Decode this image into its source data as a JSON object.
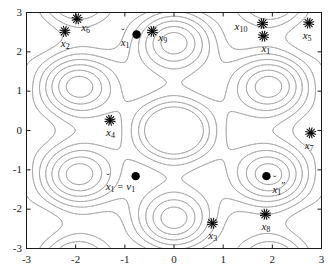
{
  "figure": {
    "kind": "contour-plot-with-scatter",
    "background_color": "#ffffff",
    "axis_color": "#1a1a1a",
    "contour_color": "#9a9a9a",
    "marker_color": "#000000",
    "width": 335,
    "height": 277
  },
  "axes": {
    "x": {
      "min": -3,
      "max": 3,
      "ticks": [
        -3,
        -2,
        -1,
        0,
        1,
        2,
        3
      ],
      "tick_labels": [
        "-3",
        "-2",
        "-1",
        "0",
        "1",
        "2",
        "3"
      ],
      "label": ""
    },
    "y": {
      "min": -3,
      "max": 3,
      "ticks": [
        -3,
        -2,
        -1,
        0,
        1,
        2,
        3
      ],
      "tick_labels": [
        "-3",
        "-2",
        "-1",
        "0",
        "1",
        "2",
        "3"
      ],
      "label": ""
    }
  },
  "chart_data": {
    "type": "scatter",
    "title": "",
    "xlabel": "",
    "ylabel": "",
    "xlim": [
      -3,
      3
    ],
    "ylim": [
      -3,
      3
    ],
    "grid": false,
    "legend": "none",
    "background_field": {
      "description": "light gray periodic contour lines of a hexagonal-lattice potential centered at origin",
      "color": "#9a9a9a",
      "levels": 9
    },
    "series": [
      {
        "name": "data points",
        "marker": "asterisk",
        "color": "#000000",
        "points": [
          {
            "label": "x_1",
            "label_text": "x",
            "sub": "1",
            "x": 1.82,
            "y": 2.4,
            "label_dx": -2,
            "label_dy": 14
          },
          {
            "label": "x_2",
            "label_text": "x",
            "sub": "2",
            "x": -2.22,
            "y": 2.52,
            "label_dx": -4,
            "label_dy": 14
          },
          {
            "label": "x_3",
            "label_text": "x",
            "sub": "3",
            "x": 0.78,
            "y": -2.36,
            "label_dx": -4,
            "label_dy": 14
          },
          {
            "label": "x_4",
            "label_text": "x",
            "sub": "4",
            "x": -1.3,
            "y": 0.26,
            "label_dx": -4,
            "label_dy": 14
          },
          {
            "label": "x_5",
            "label_text": "x",
            "sub": "5",
            "x": 2.74,
            "y": 2.73,
            "label_dx": -6,
            "label_dy": 14
          },
          {
            "label": "x_6",
            "label_text": "x",
            "sub": "6",
            "x": -1.97,
            "y": 2.84,
            "label_dx": 4,
            "label_dy": 10
          },
          {
            "label": "x_7",
            "label_text": "x",
            "sub": "7",
            "x": 2.78,
            "y": -0.06,
            "label_dx": -6,
            "label_dy": 14
          },
          {
            "label": "x_8",
            "label_text": "x",
            "sub": "8",
            "x": 1.86,
            "y": -2.13,
            "label_dx": -4,
            "label_dy": 14
          },
          {
            "label": "x_9",
            "label_text": "x",
            "sub": "9",
            "x": -0.44,
            "y": 2.52,
            "label_dx": 6,
            "label_dy": 8
          },
          {
            "label": "x_10",
            "label_text": "x",
            "sub": "10",
            "x": 1.8,
            "y": 2.72,
            "label_dx": -28,
            "label_dy": 4
          }
        ]
      },
      {
        "name": "highlighted iterates",
        "marker": "filled-circle",
        "color": "#000000",
        "points": [
          {
            "label": "x_1_check",
            "x": -0.76,
            "y": 2.44,
            "accent": "ˇ",
            "sub": "1",
            "suffix": "",
            "label_dx": -16,
            "label_dy": 9
          },
          {
            "label": "x_1_eq_v1",
            "x": -0.78,
            "y": -1.16,
            "accent": "ˇ",
            "sub": "1",
            "suffix": "",
            "label_dx": -30,
            "label_dy": 12,
            "equation": true
          },
          {
            "label": "x_1_dprime",
            "x": 1.88,
            "y": -1.16,
            "accent": "ˇ",
            "sub": "1",
            "suffix": "″",
            "label_dx": 6,
            "label_dy": 12
          }
        ]
      }
    ],
    "annotations": [
      {
        "name": "x1-check-label",
        "text": "xˇ₁"
      },
      {
        "name": "x1-equals-v1",
        "text": "xˇ₁ = v₁"
      },
      {
        "name": "x1-double-prime",
        "text": "xˇ₁″"
      }
    ]
  },
  "labels": {
    "eq_x": "x",
    "eq_sub": "1",
    "eq_op": "=",
    "eq_v": "v",
    "eq_vsub": "1",
    "accent": "ˇ",
    "dprime": "″"
  }
}
